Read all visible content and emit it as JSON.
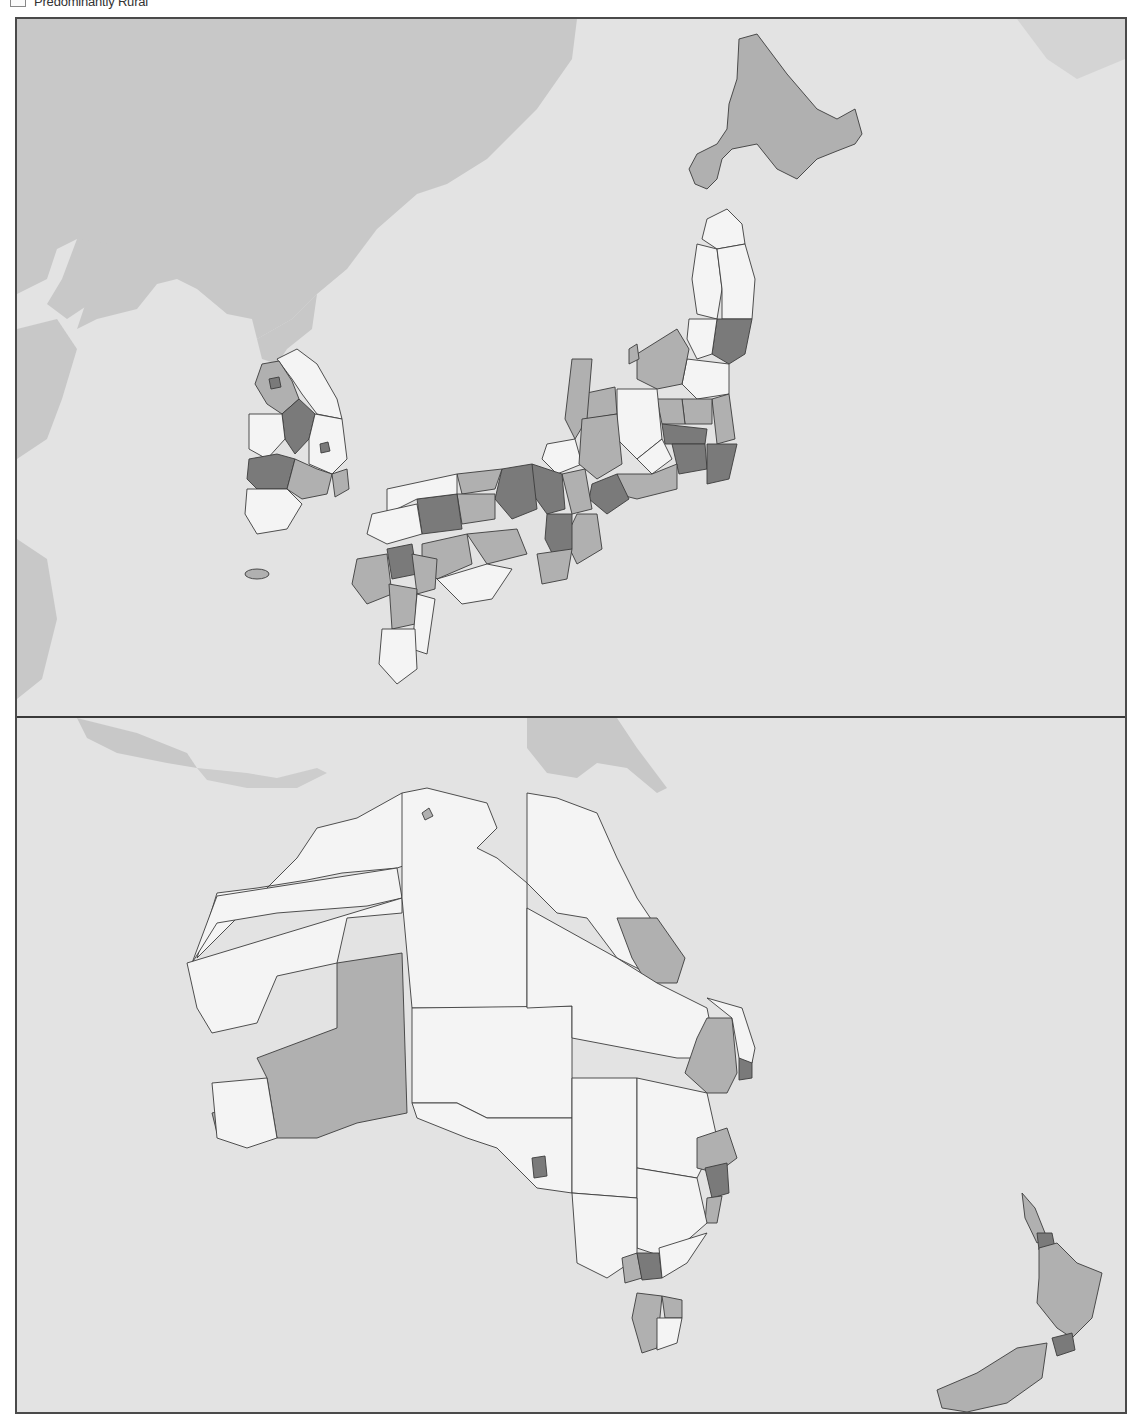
{
  "legend": {
    "items": [
      {
        "label": "Predominantly Rural",
        "swatch_color": "#fbfbfb"
      }
    ]
  },
  "colors": {
    "sea": "#e3e3e3",
    "non_data_land": "#c8c8c8",
    "rural": "#f4f4f4",
    "intermediate": "#b0b0b0",
    "urban": "#7a7a7a",
    "border": "#3c3c3c",
    "frame": "#4a4a4a"
  },
  "panels": [
    {
      "name": "north-east-asia",
      "regions_shown": [
        "China (context)",
        "North Korea (context)",
        "Russia (context)",
        "South Korea",
        "Japan"
      ]
    },
    {
      "name": "oceania",
      "regions_shown": [
        "Indonesia (context)",
        "Papua New Guinea (context)",
        "Australia",
        "New Zealand"
      ]
    }
  ]
}
